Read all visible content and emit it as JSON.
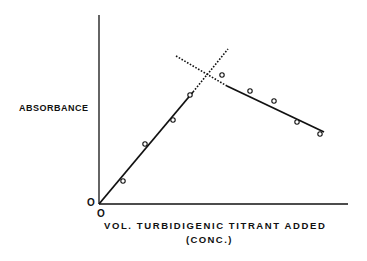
{
  "chart_data": {
    "type": "line",
    "title": "",
    "xlabel": "VOL. TURBIDIGENIC TITRANT ADDED",
    "xlabel_sub": "(CONC.)",
    "ylabel": "ABSORBANCE",
    "x_origin_label": "O",
    "y_origin_label": "O",
    "grid": false,
    "series": [
      {
        "name": "measured points",
        "style": "open-circle",
        "points_px": [
          [
            123,
            181
          ],
          [
            145,
            144
          ],
          [
            173,
            120
          ],
          [
            190,
            95
          ],
          [
            222,
            75
          ],
          [
            250,
            91
          ],
          [
            274,
            101
          ],
          [
            297,
            122
          ],
          [
            320,
            134
          ]
        ]
      },
      {
        "name": "rising fit (solid)",
        "style": "solid",
        "line_px": [
          [
            99,
            204
          ],
          [
            193,
            92
          ]
        ]
      },
      {
        "name": "rising extrapolation (dotted)",
        "style": "dotted",
        "line_px": [
          [
            193,
            92
          ],
          [
            228,
            49
          ]
        ]
      },
      {
        "name": "falling extrapolation (dotted)",
        "style": "dotted",
        "line_px": [
          [
            176,
            56
          ],
          [
            227,
            86
          ]
        ]
      },
      {
        "name": "falling fit (solid)",
        "style": "solid",
        "line_px": [
          [
            227,
            86
          ],
          [
            324,
            132
          ]
        ]
      }
    ],
    "annotation": "Equivalence point at intersection of extrapolated lines"
  }
}
